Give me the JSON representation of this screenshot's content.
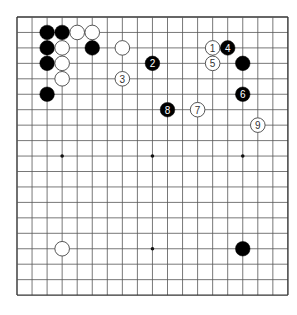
{
  "board": {
    "size": 19,
    "origin_x": 17,
    "origin_y": 17,
    "spacing_x": 15.05,
    "spacing_y": 15.45,
    "stone_radius": 7.3,
    "colors": {
      "background": "#ffffff",
      "line": "#555555",
      "border": "#333333",
      "black_stone": "#000000",
      "white_stone": "#ffffff",
      "white_stone_outline": "#444444",
      "black_label": "#ffffff",
      "white_label": "#333333"
    },
    "hoshi": [
      {
        "col": 3,
        "row": 9
      },
      {
        "col": 9,
        "row": 9
      },
      {
        "col": 15,
        "row": 9
      },
      {
        "col": 9,
        "row": 15
      }
    ]
  },
  "stones": [
    {
      "color": "black",
      "col": 2,
      "row": 1,
      "label": ""
    },
    {
      "color": "black",
      "col": 3,
      "row": 1,
      "label": ""
    },
    {
      "color": "white",
      "col": 4,
      "row": 1,
      "label": ""
    },
    {
      "color": "white",
      "col": 5,
      "row": 1,
      "label": ""
    },
    {
      "color": "black",
      "col": 2,
      "row": 2,
      "label": ""
    },
    {
      "color": "white",
      "col": 3,
      "row": 2,
      "label": ""
    },
    {
      "color": "black",
      "col": 5,
      "row": 2,
      "label": ""
    },
    {
      "color": "white",
      "col": 7,
      "row": 2,
      "label": ""
    },
    {
      "color": "black",
      "col": 2,
      "row": 3,
      "label": ""
    },
    {
      "color": "white",
      "col": 3,
      "row": 3,
      "label": ""
    },
    {
      "color": "white",
      "col": 3,
      "row": 4,
      "label": ""
    },
    {
      "color": "white",
      "col": 7,
      "row": 4,
      "label": "3"
    },
    {
      "color": "black",
      "col": 2,
      "row": 5,
      "label": ""
    },
    {
      "color": "black",
      "col": 9,
      "row": 3,
      "label": "2"
    },
    {
      "color": "white",
      "col": 13,
      "row": 2,
      "label": "1"
    },
    {
      "color": "black",
      "col": 14,
      "row": 2,
      "label": "4"
    },
    {
      "color": "white",
      "col": 13,
      "row": 3,
      "label": "5"
    },
    {
      "color": "black",
      "col": 15,
      "row": 3,
      "label": ""
    },
    {
      "color": "black",
      "col": 15,
      "row": 5,
      "label": "6"
    },
    {
      "color": "white",
      "col": 12,
      "row": 6,
      "label": "7"
    },
    {
      "color": "black",
      "col": 10,
      "row": 6,
      "label": "8"
    },
    {
      "color": "white",
      "col": 16,
      "row": 7,
      "label": "9"
    },
    {
      "color": "white",
      "col": 3,
      "row": 15,
      "label": ""
    },
    {
      "color": "black",
      "col": 15,
      "row": 15,
      "label": ""
    }
  ]
}
